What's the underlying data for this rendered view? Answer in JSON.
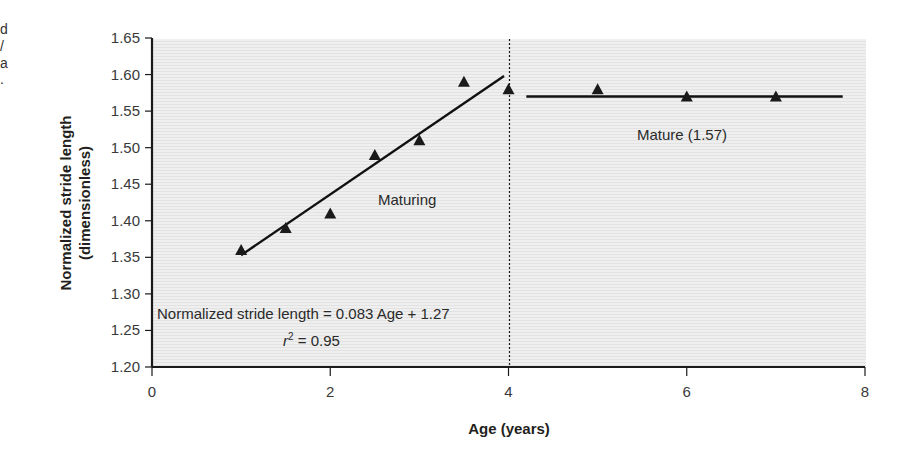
{
  "caption_fragments": [
    "d",
    "/",
    "a",
    "."
  ],
  "chart_data": {
    "type": "scatter",
    "title": "",
    "xlabel": "Age (years)",
    "ylabel_lines": [
      "Normalized stride length",
      "(dimensionless)"
    ],
    "xlim": [
      0,
      8
    ],
    "ylim": [
      1.2,
      1.65
    ],
    "x_ticks": [
      0,
      2,
      4,
      6,
      8
    ],
    "y_ticks": [
      "1.20",
      "1.25",
      "1.30",
      "1.35",
      "1.40",
      "1.45",
      "1.50",
      "1.55",
      "1.60",
      "1.65"
    ],
    "grid": false,
    "marker": "triangle",
    "series": [
      {
        "name": "Maturing",
        "x": [
          1.0,
          1.5,
          2.0,
          2.5,
          3.0,
          3.5,
          4.0
        ],
        "y": [
          1.36,
          1.39,
          1.41,
          1.49,
          1.51,
          1.59,
          1.58
        ]
      },
      {
        "name": "Mature",
        "x": [
          5.0,
          6.0,
          7.0
        ],
        "y": [
          1.58,
          1.57,
          1.57
        ]
      }
    ],
    "fit_lines": [
      {
        "name": "Maturing fit",
        "x": [
          1.0,
          3.95
        ],
        "y": [
          1.353,
          1.598
        ]
      },
      {
        "name": "Mature mean",
        "x": [
          4.2,
          7.75
        ],
        "y": [
          1.57,
          1.57
        ]
      }
    ],
    "divider": {
      "x": 4,
      "style": "dotted"
    },
    "annotations": {
      "maturing_label": "Maturing",
      "mature_label": "Mature (1.57)",
      "equation": "Normalized stride length = 0.083 Age   + 1.27",
      "r_squared_symbol": "r",
      "r_squared_exp": "2",
      "r_squared_value": " = 0.95"
    },
    "colors": {
      "plot_background": "#ececec",
      "markers": "#1a1a1a",
      "lines": "#111111",
      "axes": "#1a1a1a"
    }
  }
}
